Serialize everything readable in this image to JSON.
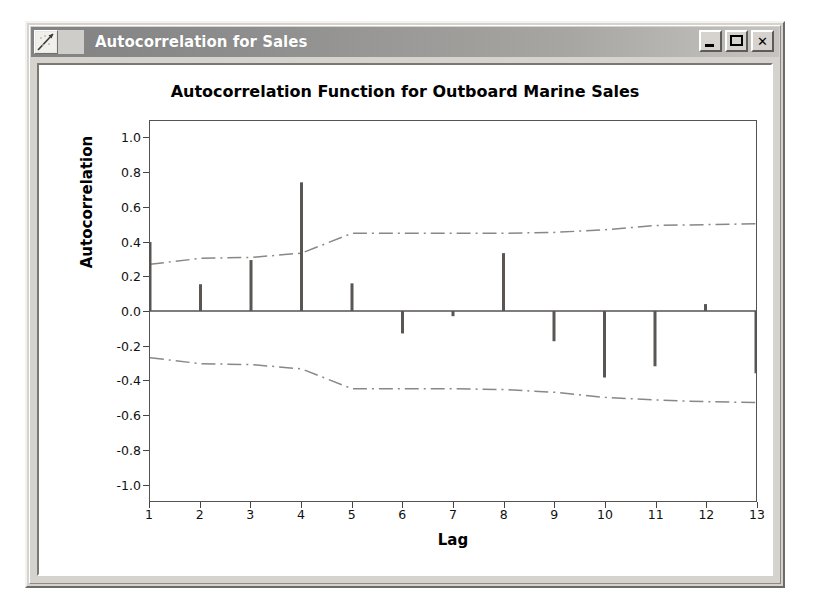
{
  "window": {
    "title": "Autocorrelation for Sales",
    "icon": "line-chart-icon",
    "buttons": {
      "minimize": "minimize",
      "maximize": "maximize",
      "close": "close"
    }
  },
  "chart_data": {
    "type": "bar",
    "title": "Autocorrelation Function for Outboard Marine Sales",
    "xlabel": "Lag",
    "ylabel": "Autocorrelation",
    "categories": [
      1,
      2,
      3,
      4,
      5,
      6,
      7,
      8,
      9,
      10,
      11,
      12,
      13
    ],
    "values": [
      0.4,
      0.155,
      0.295,
      0.745,
      0.16,
      -0.13,
      -0.03,
      0.335,
      -0.175,
      -0.385,
      -0.32,
      0.04,
      -0.36
    ],
    "ylim": [
      -1.1,
      1.1
    ],
    "yticks": [
      1.0,
      0.8,
      0.6,
      0.4,
      0.2,
      0.0,
      -0.2,
      -0.4,
      -0.6,
      -0.8,
      -1.0
    ],
    "ytick_labels": [
      "1.0",
      "0.8",
      "0.6",
      "0.4",
      "0.2",
      "0.0",
      "-0.2",
      "-0.4",
      "-0.6",
      "-0.8",
      "-1.0"
    ],
    "xticks": [
      1,
      2,
      3,
      4,
      5,
      6,
      7,
      8,
      9,
      10,
      11,
      12,
      13
    ],
    "xtick_labels": [
      "1",
      "2",
      "3",
      "4",
      "5",
      "6",
      "7",
      "8",
      "9",
      "10",
      "11",
      "12",
      "13"
    ],
    "grid": false,
    "legend": "none",
    "zero_line": 0.0,
    "series": [
      {
        "name": "Autocorrelation",
        "type": "stem",
        "values": [
          0.4,
          0.155,
          0.295,
          0.745,
          0.16,
          -0.13,
          -0.03,
          0.335,
          -0.175,
          -0.385,
          -0.32,
          0.04,
          -0.36
        ]
      },
      {
        "name": "Upper confidence limit",
        "type": "dashdot-line",
        "values": [
          0.27,
          0.305,
          0.31,
          0.335,
          0.45,
          0.45,
          0.45,
          0.45,
          0.455,
          0.47,
          0.495,
          0.5,
          0.505
        ]
      },
      {
        "name": "Lower confidence limit",
        "type": "dashdot-line",
        "values": [
          -0.27,
          -0.305,
          -0.31,
          -0.335,
          -0.45,
          -0.45,
          -0.45,
          -0.455,
          -0.47,
          -0.5,
          -0.515,
          -0.525,
          -0.53
        ]
      }
    ],
    "colors": {
      "stem": "#595654",
      "confidence": "#8a8785",
      "axis": "#555252",
      "background": "#ffffff"
    }
  }
}
